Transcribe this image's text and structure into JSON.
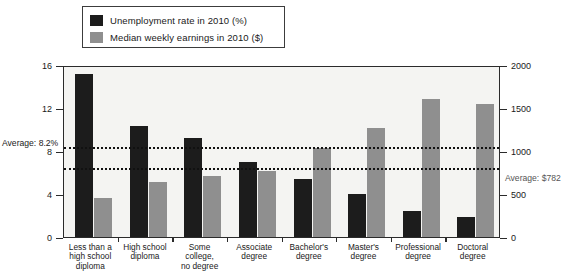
{
  "legend": {
    "items": [
      {
        "label": "Unemployment rate in 2010 (%)",
        "color": "#1c1c1c",
        "swatch_name": "legend-swatch-unemployment"
      },
      {
        "label": "Median weekly earnings in 2010 ($)",
        "color": "#8f8f8f",
        "swatch_name": "legend-swatch-earnings"
      }
    ]
  },
  "annotations": {
    "avg_unemployment_label": "Average: 8.2%",
    "avg_earnings_label": "Average: $782"
  },
  "chart_data": {
    "type": "bar",
    "title": "",
    "xlabel": "",
    "categories": [
      "Less than a\nhigh school\ndiploma",
      "High school\ndiploma",
      "Some\ncollege,\nno degree",
      "Associate\ndegree",
      "Bachelor's\ndegree",
      "Master's\ndegree",
      "Professional\ndegree",
      "Doctoral\ndegree"
    ],
    "series": [
      {
        "name": "Unemployment rate in 2010 (%)",
        "axis": "left",
        "color": "#1c1c1c",
        "values": [
          15.2,
          10.3,
          9.2,
          7.0,
          5.4,
          4.0,
          2.4,
          1.9
        ]
      },
      {
        "name": "Median weekly earnings in 2010 ($)",
        "axis": "right",
        "color": "#8f8f8f",
        "values": [
          450,
          638,
          712,
          767,
          1038,
          1272,
          1610,
          1550
        ]
      }
    ],
    "left_axis": {
      "label": "",
      "ticks": [
        0,
        4,
        8,
        12,
        16
      ],
      "ylim": [
        0,
        16
      ]
    },
    "right_axis": {
      "label": "",
      "ticks": [
        0,
        500,
        1000,
        1500,
        2000
      ],
      "ylim": [
        0,
        2000
      ]
    },
    "reference_lines": [
      {
        "name": "average-unemployment",
        "axis": "left",
        "value": 8.2,
        "style": "dotted",
        "label": "Average: 8.2%"
      },
      {
        "name": "average-earnings",
        "axis": "right",
        "value": 782,
        "style": "dotted",
        "label": "Average: $782"
      }
    ],
    "grid": false,
    "legend_position": "top"
  }
}
